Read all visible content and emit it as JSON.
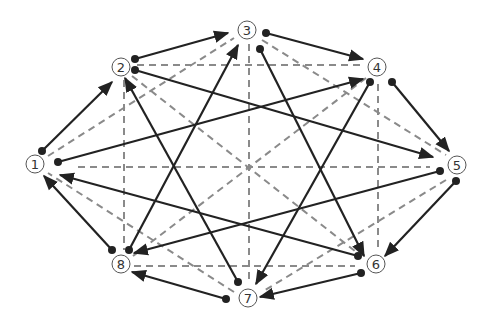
{
  "diagram": {
    "title": "",
    "colors": {
      "solid_edge": "#222222",
      "dashed_edge": "#8a8a8a",
      "node_outline": "#555555",
      "label_text": "#333333",
      "background": "#ffffff"
    },
    "nodes": [
      {
        "id": 1,
        "label": "1",
        "x": 35,
        "y": 164
      },
      {
        "id": 2,
        "label": "2",
        "x": 121,
        "y": 67
      },
      {
        "id": 3,
        "label": "3",
        "x": 247,
        "y": 30
      },
      {
        "id": 4,
        "label": "4",
        "x": 377,
        "y": 67
      },
      {
        "id": 5,
        "label": "5",
        "x": 457,
        "y": 165
      },
      {
        "id": 6,
        "label": "6",
        "x": 376,
        "y": 264
      },
      {
        "id": 7,
        "label": "7",
        "x": 248,
        "y": 298
      },
      {
        "id": 8,
        "label": "8",
        "x": 121,
        "y": 264
      }
    ],
    "directed_edges": [
      {
        "from": 1,
        "to": 2,
        "x1": 42,
        "y1": 151,
        "x2": 112,
        "y2": 82
      },
      {
        "from": 2,
        "to": 3,
        "x1": 135,
        "y1": 59,
        "x2": 228,
        "y2": 33
      },
      {
        "from": 3,
        "to": 4,
        "x1": 266,
        "y1": 33,
        "x2": 363,
        "y2": 59
      },
      {
        "from": 4,
        "to": 5,
        "x1": 392,
        "y1": 82,
        "x2": 449,
        "y2": 151
      },
      {
        "from": 5,
        "to": 6,
        "x1": 456,
        "y1": 181,
        "x2": 385,
        "y2": 256
      },
      {
        "from": 6,
        "to": 7,
        "x1": 361,
        "y1": 273,
        "x2": 260,
        "y2": 297
      },
      {
        "from": 7,
        "to": 8,
        "x1": 226,
        "y1": 299,
        "x2": 132,
        "y2": 272
      },
      {
        "from": 8,
        "to": 1,
        "x1": 112,
        "y1": 250,
        "x2": 44,
        "y2": 176
      },
      {
        "from": 1,
        "to": 4,
        "x1": 58,
        "y1": 162,
        "x2": 363,
        "y2": 79
      },
      {
        "from": 2,
        "to": 5,
        "x1": 135,
        "y1": 70,
        "x2": 433,
        "y2": 157
      },
      {
        "from": 3,
        "to": 6,
        "x1": 260,
        "y1": 49,
        "x2": 364,
        "y2": 256
      },
      {
        "from": 4,
        "to": 7,
        "x1": 370,
        "y1": 82,
        "x2": 256,
        "y2": 284
      },
      {
        "from": 5,
        "to": 8,
        "x1": 440,
        "y1": 171,
        "x2": 134,
        "y2": 253
      },
      {
        "from": 6,
        "to": 1,
        "x1": 358,
        "y1": 256,
        "x2": 60,
        "y2": 175
      },
      {
        "from": 7,
        "to": 2,
        "x1": 238,
        "y1": 282,
        "x2": 125,
        "y2": 78
      },
      {
        "from": 8,
        "to": 3,
        "x1": 129,
        "y1": 250,
        "x2": 238,
        "y2": 45
      }
    ],
    "dashed_edges": [
      {
        "a": 1,
        "b": 3,
        "x1": 48,
        "y1": 156,
        "x2": 234,
        "y2": 38
      },
      {
        "a": 3,
        "b": 5,
        "x1": 262,
        "y1": 40,
        "x2": 446,
        "y2": 155
      },
      {
        "a": 5,
        "b": 7,
        "x1": 446,
        "y1": 180,
        "x2": 262,
        "y2": 292
      },
      {
        "a": 7,
        "b": 1,
        "x1": 234,
        "y1": 292,
        "x2": 48,
        "y2": 173
      },
      {
        "a": 2,
        "b": 4,
        "x1": 137,
        "y1": 65,
        "x2": 362,
        "y2": 65
      },
      {
        "a": 8,
        "b": 6,
        "x1": 134,
        "y1": 266,
        "x2": 355,
        "y2": 266
      },
      {
        "a": 2,
        "b": 8,
        "x1": 124,
        "y1": 80,
        "x2": 124,
        "y2": 250
      },
      {
        "a": 4,
        "b": 6,
        "x1": 378,
        "y1": 84,
        "x2": 378,
        "y2": 250
      },
      {
        "a": 1,
        "b": 5,
        "x1": 78,
        "y1": 167,
        "x2": 430,
        "y2": 167
      },
      {
        "a": 3,
        "b": 7,
        "x1": 249,
        "y1": 44,
        "x2": 249,
        "y2": 284
      },
      {
        "a": 2,
        "b": 6,
        "x1": 132,
        "y1": 76,
        "x2": 360,
        "y2": 255
      },
      {
        "a": 4,
        "b": 8,
        "x1": 366,
        "y1": 78,
        "x2": 133,
        "y2": 256
      }
    ]
  }
}
